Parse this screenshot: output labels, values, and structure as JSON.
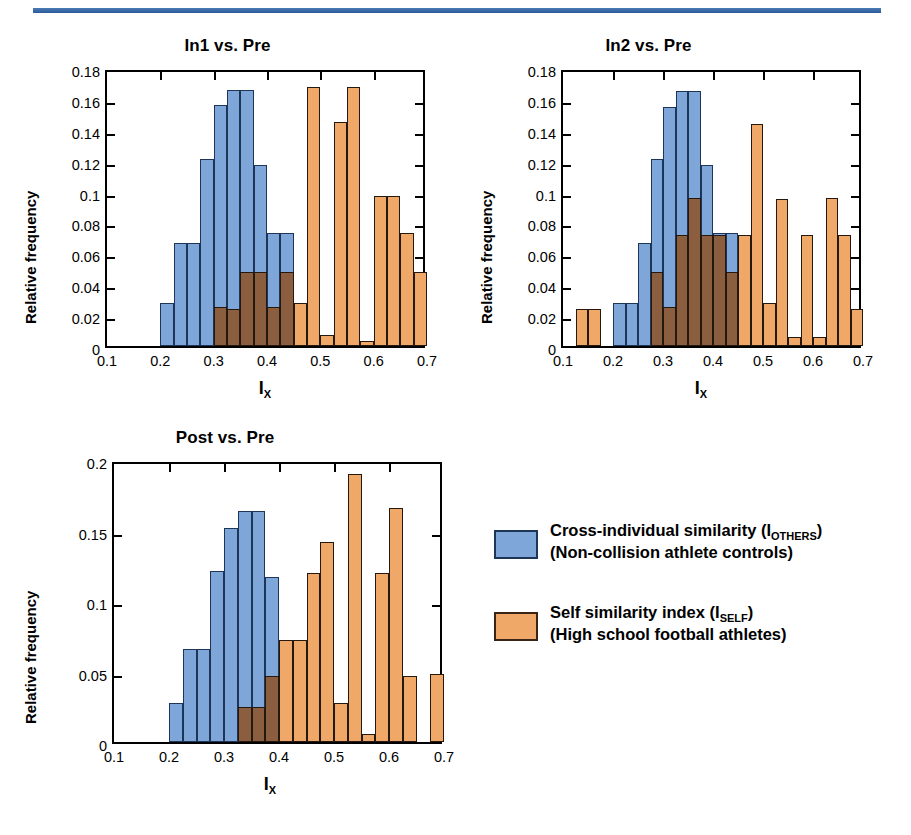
{
  "figure": {
    "x_axis_label": "I",
    "x_axis_sub": "X",
    "y_axis_label": "Relative frequency",
    "colors": {
      "blue": "#7fa6d8",
      "orange": "#f0a868",
      "overlap": "#8a5e3e",
      "rule": "#2a5a99"
    }
  },
  "legend": {
    "items": [
      {
        "swatch": "blue",
        "line1_pre": "Cross-individual similarity (I",
        "line1_sub": "OTHERS",
        "line1_post": ")",
        "line2": "(Non-collision athlete controls)"
      },
      {
        "swatch": "orange",
        "line1_pre": "Self similarity index (I",
        "line1_sub": "SELF",
        "line1_post": ")",
        "line2": "(High school football athletes)"
      }
    ]
  },
  "chart_data": [
    {
      "id": "panel1",
      "type": "bar",
      "title": "In1 vs. Pre",
      "xlabel": "I_X",
      "ylabel": "Relative frequency",
      "xlim": [
        0.1,
        0.7
      ],
      "ylim": [
        0,
        0.18
      ],
      "xticks": [
        "0.1",
        "0.2",
        "0.3",
        "0.4",
        "0.5",
        "0.6",
        "0.7"
      ],
      "yticks": [
        "0",
        "0.02",
        "0.04",
        "0.06",
        "0.08",
        "0.1",
        "0.12",
        "0.14",
        "0.16",
        "0.18"
      ],
      "bin_width": 0.025,
      "bin_starts": [
        0.1,
        0.125,
        0.15,
        0.175,
        0.2,
        0.225,
        0.25,
        0.275,
        0.3,
        0.325,
        0.35,
        0.375,
        0.4,
        0.425,
        0.45,
        0.475,
        0.5,
        0.525,
        0.55,
        0.575,
        0.6,
        0.625,
        0.65,
        0.675
      ],
      "series": [
        {
          "name": "Cross-individual similarity (I_OTHERS)",
          "color": "#7fa6d8",
          "values": [
            0,
            0,
            0,
            0,
            0.028,
            0.067,
            0.067,
            0.121,
            0.156,
            0.166,
            0.166,
            0.117,
            0.073,
            0.073,
            0,
            0,
            0,
            0,
            0,
            0,
            0,
            0,
            0,
            0
          ]
        },
        {
          "name": "Self similarity index (I_SELF)",
          "color": "#f0a868",
          "values": [
            0,
            0,
            0,
            0,
            0,
            0,
            0,
            0,
            0.025,
            0.024,
            0.048,
            0.048,
            0.025,
            0.048,
            0.028,
            0.168,
            0.007,
            0.145,
            0.168,
            0.003,
            0.097,
            0.097,
            0.073,
            0.048
          ]
        }
      ]
    },
    {
      "id": "panel2",
      "type": "bar",
      "title": "In2 vs. Pre",
      "xlabel": "I_X",
      "ylabel": "Relative frequency",
      "xlim": [
        0.1,
        0.7
      ],
      "ylim": [
        0,
        0.18
      ],
      "xticks": [
        "0.1",
        "0.2",
        "0.3",
        "0.4",
        "0.5",
        "0.6",
        "0.7"
      ],
      "yticks": [
        "0",
        "0.02",
        "0.04",
        "0.06",
        "0.08",
        "0.1",
        "0.12",
        "0.14",
        "0.16",
        "0.18"
      ],
      "bin_width": 0.025,
      "bin_starts": [
        0.1,
        0.125,
        0.15,
        0.175,
        0.2,
        0.225,
        0.25,
        0.275,
        0.3,
        0.325,
        0.35,
        0.375,
        0.4,
        0.425,
        0.45,
        0.475,
        0.5,
        0.525,
        0.55,
        0.575,
        0.6,
        0.625,
        0.65,
        0.675
      ],
      "series": [
        {
          "name": "Cross-individual similarity (I_OTHERS)",
          "color": "#7fa6d8",
          "values": [
            0,
            0,
            0,
            0,
            0.028,
            0.028,
            0.067,
            0.121,
            0.155,
            0.165,
            0.165,
            0.117,
            0.073,
            0.073,
            0,
            0,
            0,
            0,
            0,
            0,
            0,
            0,
            0,
            0
          ]
        },
        {
          "name": "Self similarity index (I_SELF)",
          "color": "#f0a868",
          "values": [
            0,
            0.024,
            0.024,
            0,
            0,
            0,
            0,
            0.048,
            0.025,
            0.072,
            0.096,
            0.072,
            0.072,
            0.048,
            0.072,
            0.144,
            0.028,
            0.095,
            0.006,
            0.072,
            0.006,
            0.096,
            0.072,
            0.024
          ]
        }
      ]
    },
    {
      "id": "panel3",
      "type": "bar",
      "title": "Post vs. Pre",
      "xlabel": "I_X",
      "ylabel": "Relative frequency",
      "xlim": [
        0.1,
        0.7
      ],
      "ylim": [
        0,
        0.2
      ],
      "xticks": [
        "0.1",
        "0.2",
        "0.3",
        "0.4",
        "0.5",
        "0.6",
        "0.7"
      ],
      "yticks": [
        "0",
        "0.05",
        "0.1",
        "0.15",
        "0.2"
      ],
      "bin_width": 0.025,
      "bin_starts": [
        0.1,
        0.125,
        0.15,
        0.175,
        0.2,
        0.225,
        0.25,
        0.275,
        0.3,
        0.325,
        0.35,
        0.375,
        0.4,
        0.425,
        0.45,
        0.475,
        0.5,
        0.525,
        0.55,
        0.575,
        0.6,
        0.625,
        0.65,
        0.675
      ],
      "series": [
        {
          "name": "Cross-individual similarity (I_OTHERS)",
          "color": "#7fa6d8",
          "values": [
            0,
            0,
            0,
            0,
            0.028,
            0.066,
            0.066,
            0.121,
            0.152,
            0.164,
            0.164,
            0.117,
            0,
            0,
            0,
            0,
            0,
            0,
            0,
            0,
            0,
            0,
            0,
            0
          ]
        },
        {
          "name": "Self similarity index (I_SELF)",
          "color": "#f0a868",
          "values": [
            0,
            0,
            0,
            0,
            0,
            0,
            0,
            0,
            0,
            0.025,
            0.025,
            0.047,
            0.072,
            0.072,
            0.12,
            0.142,
            0.028,
            0.19,
            0.006,
            0.12,
            0.166,
            0.047,
            0,
            0.048
          ]
        }
      ]
    }
  ]
}
